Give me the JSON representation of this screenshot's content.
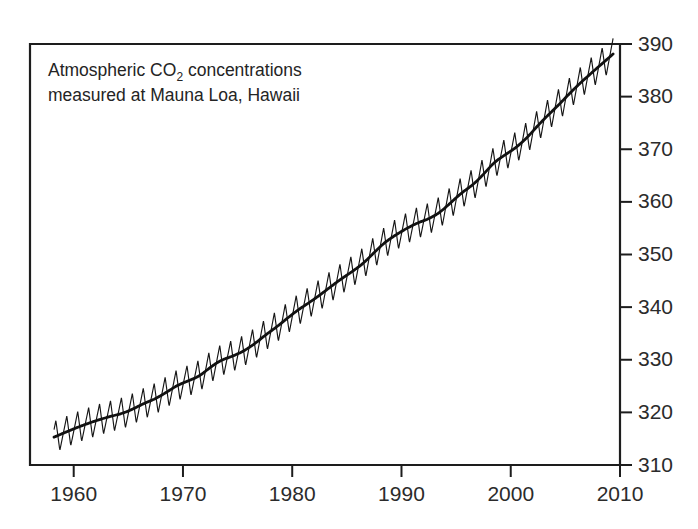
{
  "chart_data": {
    "type": "line",
    "title": "",
    "annotation": {
      "line1_prefix": "Atmospheric CO",
      "line1_sub": "2",
      "line1_suffix": " concentrations",
      "line2": "measured at Mauna Loa, Hawaii"
    },
    "xlabel": "",
    "ylabel": "",
    "xlim": [
      1956.0,
      2010.0
    ],
    "ylim": [
      310,
      390
    ],
    "xticks": [
      1960,
      1970,
      1980,
      1990,
      2000,
      2010
    ],
    "xtick_labels": [
      "1960",
      "1970",
      "1980",
      "1990",
      "2000",
      "2010"
    ],
    "yticks": [
      310,
      320,
      330,
      340,
      350,
      360,
      370,
      380,
      390
    ],
    "ytick_labels": [
      "310",
      "320",
      "330",
      "340",
      "350",
      "360",
      "370",
      "380",
      "390"
    ],
    "y_axis_position": "right",
    "grid": false,
    "legend": "none",
    "units": "ppm",
    "seasonal_amplitude_ppm": 6.0,
    "seasonal_peak_month": "May",
    "seasonal_trough_month": "September",
    "series": [
      {
        "name": "Monthly mean CO2 (seasonal cycle)",
        "style": "thin-sawtooth",
        "x": [
          1958.2,
          1959,
          1960,
          1961,
          1962,
          1963,
          1964,
          1965,
          1966,
          1967,
          1968,
          1969,
          1970,
          1971,
          1972,
          1973,
          1974,
          1975,
          1976,
          1977,
          1978,
          1979,
          1980,
          1981,
          1982,
          1983,
          1984,
          1985,
          1986,
          1987,
          1988,
          1989,
          1990,
          1991,
          1992,
          1993,
          1994,
          1995,
          1996,
          1997,
          1998,
          1999,
          2000,
          2001,
          2002,
          2003,
          2004,
          2005,
          2006,
          2007,
          2008,
          2009
        ],
        "values": [
          315.3,
          315.98,
          316.91,
          317.64,
          318.45,
          318.99,
          319.62,
          320.04,
          321.38,
          322.16,
          323.04,
          324.62,
          325.68,
          326.32,
          327.45,
          329.68,
          330.18,
          331.11,
          332.04,
          333.83,
          335.4,
          336.84,
          338.75,
          340.11,
          341.45,
          343.05,
          344.65,
          346.12,
          347.42,
          349.19,
          351.57,
          353.12,
          354.39,
          355.61,
          356.45,
          357.1,
          358.83,
          360.82,
          362.61,
          363.73,
          366.7,
          368.38,
          369.55,
          371.14,
          373.28,
          375.8,
          377.52,
          379.8,
          381.9,
          383.79,
          385.6,
          387.43
        ]
      },
      {
        "name": "Deseasonalized trend",
        "style": "thick-smooth",
        "x": [
          1958.2,
          1959,
          1960,
          1961,
          1962,
          1963,
          1964,
          1965,
          1966,
          1967,
          1968,
          1969,
          1970,
          1971,
          1972,
          1973,
          1974,
          1975,
          1976,
          1977,
          1978,
          1979,
          1980,
          1981,
          1982,
          1983,
          1984,
          1985,
          1986,
          1987,
          1988,
          1989,
          1990,
          1991,
          1992,
          1993,
          1994,
          1995,
          1996,
          1997,
          1998,
          1999,
          2000,
          2001,
          2002,
          2003,
          2004,
          2005,
          2006,
          2007,
          2008,
          2009
        ],
        "values": [
          315.3,
          315.98,
          316.91,
          317.64,
          318.45,
          318.99,
          319.62,
          320.04,
          321.38,
          322.16,
          323.04,
          324.62,
          325.68,
          326.32,
          327.45,
          329.68,
          330.18,
          331.11,
          332.04,
          333.83,
          335.4,
          336.84,
          338.75,
          340.11,
          341.45,
          343.05,
          344.65,
          346.12,
          347.42,
          349.19,
          351.57,
          353.12,
          354.39,
          355.61,
          356.45,
          357.1,
          358.83,
          360.82,
          362.61,
          363.73,
          366.7,
          368.38,
          369.55,
          371.14,
          373.28,
          375.8,
          377.52,
          379.8,
          381.9,
          383.79,
          385.6,
          387.43
        ]
      }
    ],
    "data_start_year": 1958.2,
    "data_end_year": 2009.4,
    "value_start_ppm": 315.3,
    "value_end_ppm": 387.4,
    "colors": {
      "line": "#141414",
      "axis": "#1d1d1d",
      "text": "#2b2b2b",
      "background": "#ffffff"
    }
  }
}
